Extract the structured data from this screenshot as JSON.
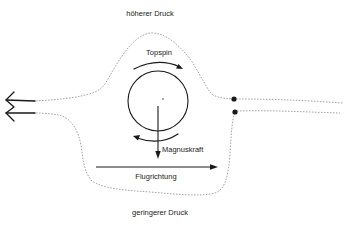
{
  "diagram": {
    "labels": {
      "high_pressure": "höherer Druck",
      "low_pressure": "geringerer Druck",
      "spin": "Topspin",
      "force": "Magnuskraft",
      "direction": "Flugrichtung"
    },
    "colors": {
      "line": "#1a1a1a",
      "flow_line": "#9a9a9a",
      "text": "#222222",
      "background": "#ffffff"
    },
    "elements": {
      "ball": {
        "cx": 158,
        "cy": 101,
        "r": 30
      },
      "separation_points": [
        {
          "x": 234,
          "y": 99
        },
        {
          "x": 235,
          "y": 112
        }
      ],
      "flight_arrow": {
        "x1": 96,
        "y1": 167,
        "x2": 217,
        "y2": 167
      },
      "magnus_arrow": {
        "x1": 158,
        "y1": 106,
        "x2": 158,
        "y2": 158
      }
    }
  }
}
